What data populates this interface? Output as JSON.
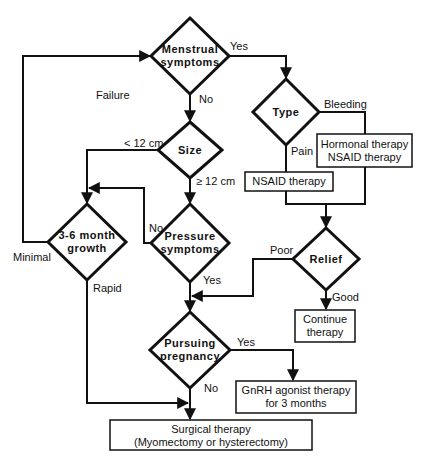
{
  "diagram": {
    "type": "flowchart",
    "nodes": {
      "menstrual": {
        "line1": "Menstrual",
        "line2": "symptoms"
      },
      "type": {
        "label": "Type"
      },
      "size": {
        "label": "Size"
      },
      "pressure": {
        "line1": "Pressure",
        "line2": "symptoms"
      },
      "growth": {
        "line1": "3-6  month",
        "line2": "growth"
      },
      "relief": {
        "label": "Relief"
      },
      "pregnancy": {
        "line1": "Pursuing",
        "line2": "pregnancy"
      },
      "hormonal_box": {
        "line1": "Hormonal therapy",
        "line2": "NSAID therapy"
      },
      "nsaid_box": {
        "label": "NSAID therapy"
      },
      "continue_box": {
        "line1": "Continue",
        "line2": "therapy"
      },
      "gnrh_box": {
        "line1": "GnRH agonist therapy",
        "line2": "for 3 months"
      },
      "surgical_box": {
        "line1": "Surgical therapy",
        "line2": "(Myomectomy or hysterectomy)"
      }
    },
    "edge_labels": {
      "menstrual_yes": "Yes",
      "menstrual_no": "No",
      "failure": "Failure",
      "type_bleeding": "Bleeding",
      "type_pain": "Pain",
      "size_lt": "< 12 cm",
      "size_ge": "≥ 12 cm",
      "pressure_no": "No",
      "pressure_yes": "Yes",
      "growth_minimal": "Minimal",
      "growth_rapid": "Rapid",
      "relief_poor": "Poor",
      "relief_good": "Good",
      "pregnancy_yes": "Yes",
      "pregnancy_no": "No"
    },
    "colors": {
      "stroke": "#111111",
      "background": "#ffffff"
    }
  }
}
